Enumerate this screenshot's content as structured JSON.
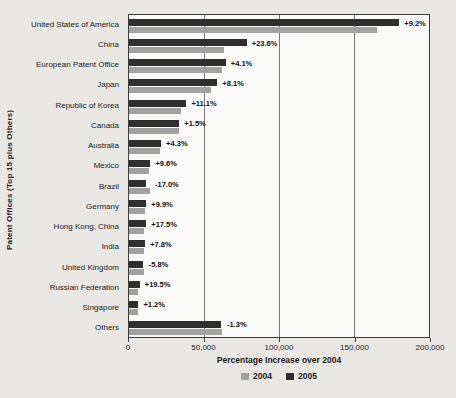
{
  "chart_data": {
    "type": "bar",
    "orientation": "horizontal",
    "xlabel": "Percentage Increase over 2004",
    "ylabel": "Patent Offices (Top 15 plus Others)",
    "xlim": [
      0,
      200000
    ],
    "xticks": [
      "0",
      "50,000",
      "100,000",
      "150,000",
      "200,000"
    ],
    "grid": "vertical",
    "legend_position": "bottom",
    "categories": [
      "United States of America",
      "China",
      "European Patent Office",
      "Japan",
      "Republic of Korea",
      "Canada",
      "Australia",
      "Mexico",
      "Brazil",
      "Germany",
      "Hong Kong, China",
      "India",
      "United Kingdom",
      "Russian Federation",
      "Singapore",
      "Others"
    ],
    "series": [
      {
        "name": "2004",
        "color": "#a2a2a2",
        "values": [
          165000,
          63500,
          62000,
          54500,
          34500,
          33000,
          20500,
          13000,
          14000,
          10500,
          9800,
          10000,
          9800,
          6000,
          6200,
          62000
        ]
      },
      {
        "name": "2005",
        "color": "#2f2f2f",
        "values": [
          180200,
          78500,
          64500,
          58900,
          38300,
          33500,
          21400,
          14250,
          11600,
          11500,
          11500,
          10800,
          9200,
          7200,
          6270,
          61200
        ]
      }
    ],
    "annotations": [
      "+9.2%",
      "+23.6%",
      "+4.1%",
      "+8.1%",
      "+11.1%",
      "+1.5%",
      "+4.3%",
      "+9.6%",
      "-17.0%",
      "+9.9%",
      "+17.5%",
      "+7.8%",
      "-5.8%",
      "+19.5%",
      "+1.2%",
      "-1.3%"
    ],
    "legend_items": [
      {
        "label": "2004",
        "color": "#a2a2a2"
      },
      {
        "label": "2005",
        "color": "#2f2f2f"
      }
    ]
  },
  "colors": {
    "page_background": "#e9e8e5",
    "plot_background": "#fafaf8",
    "plot_border": "#3b3b3b",
    "gridline": "#787878"
  }
}
